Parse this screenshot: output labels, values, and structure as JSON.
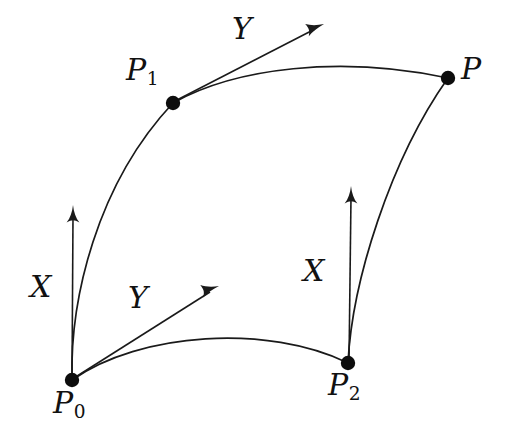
{
  "figure": {
    "background_color": "#ffffff",
    "ink_color": "#1a1a1a",
    "width": 510,
    "height": 446,
    "points": [
      {
        "id": "P0",
        "base": "P",
        "subscript": "0",
        "label": "P0",
        "x": 72,
        "y": 380,
        "label_x": 53,
        "label_y": 388
      },
      {
        "id": "P1",
        "base": "P",
        "subscript": "1",
        "label": "P1",
        "x": 173,
        "y": 103,
        "label_x": 126,
        "label_y": 55
      },
      {
        "id": "P2",
        "base": "P",
        "subscript": "2",
        "label": "P2",
        "x": 348,
        "y": 363,
        "label_x": 328,
        "label_y": 370
      },
      {
        "id": "P",
        "base": "P",
        "subscript": "",
        "label": "P",
        "x": 448,
        "y": 78,
        "label_x": 461,
        "label_y": 54
      }
    ],
    "vectors": [
      {
        "id": "X-at-P0",
        "label": "X",
        "from": "P0",
        "tip_x": 73,
        "tip_y": 210,
        "label_x": 30,
        "label_y": 272
      },
      {
        "id": "Y-at-P0",
        "label": "Y",
        "from": "P0",
        "tip_x": 216,
        "tip_y": 288,
        "label_x": 128,
        "label_y": 283
      },
      {
        "id": "X-at-P2",
        "label": "X",
        "from": "P2",
        "tip_x": 351,
        "tip_y": 191,
        "label_x": 303,
        "label_y": 256
      },
      {
        "id": "Y-at-P1",
        "label": "Y",
        "from": "P1",
        "tip_x": 321,
        "tip_y": 24,
        "label_x": 232,
        "label_y": 14
      }
    ],
    "curves": [
      {
        "id": "curve-P0-P1",
        "from": "P0",
        "to": "P1"
      },
      {
        "id": "curve-P1-P",
        "from": "P1",
        "to": "P"
      },
      {
        "id": "curve-P0-P2",
        "from": "P0",
        "to": "P2"
      },
      {
        "id": "curve-P2-P",
        "from": "P2",
        "to": "P"
      }
    ]
  }
}
